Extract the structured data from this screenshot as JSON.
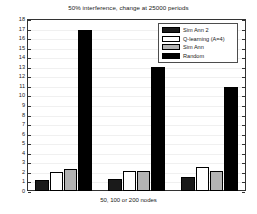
{
  "chart_data": {
    "type": "bar",
    "title": "50% interference, change at 25000 periods",
    "xlabel": "50, 100 or 200 nodes",
    "ylabel": "",
    "categories": [
      "50 nodes",
      "100 nodes",
      "200 nodes"
    ],
    "series": [
      {
        "name": "Sim Ann 2",
        "color": "#1a1a1a",
        "values": [
          1.15,
          1.3,
          1.45
        ]
      },
      {
        "name": "Q-learning (A=4)",
        "color": "#ffffff",
        "values": [
          2.0,
          2.1,
          2.5
        ]
      },
      {
        "name": "Sim Ann",
        "color": "#b3b3b3",
        "values": [
          2.35,
          2.05,
          2.1
        ]
      },
      {
        "name": "Random",
        "color": "#000000",
        "values": [
          16.8,
          13.0,
          10.85
        ]
      }
    ],
    "ylim": [
      0,
      18
    ],
    "yticks": [
      0,
      1,
      2,
      3,
      4,
      5,
      6,
      7,
      8,
      9,
      10,
      11,
      12,
      13,
      14,
      15,
      16,
      17,
      18
    ],
    "ytick_labels": [
      "0",
      "1",
      "2",
      "3",
      "4",
      "5",
      "6",
      "7",
      "8",
      "9",
      "10",
      "11",
      "12",
      "13",
      "14",
      "15",
      "16",
      "17",
      "18"
    ],
    "grid": true,
    "legend_position": "top-right",
    "legend_entries": [
      "Sim Ann 2",
      "Q-learning (A=4)",
      "Sim Ann",
      "Random"
    ]
  }
}
